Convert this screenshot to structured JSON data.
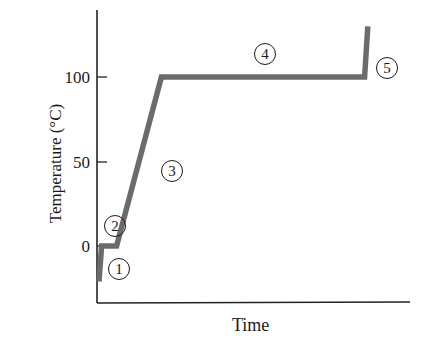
{
  "chart_data": {
    "type": "line",
    "title": "",
    "xlabel": "Time",
    "ylabel": "Temperature (°C)",
    "yticks": [
      0,
      50,
      100
    ],
    "ytick_labels": [
      "0",
      "50",
      "100"
    ],
    "ylim": [
      -33,
      140
    ],
    "xticks": [],
    "grid": false,
    "legend": null,
    "series": [
      {
        "name": "Heating curve",
        "color": "#6b6b6b",
        "x": [
          0.0,
          0.8,
          5.5,
          19.5,
          83.0,
          84.0
        ],
        "y": [
          -21,
          0,
          0,
          100,
          100,
          130
        ]
      }
    ],
    "annotations": [
      {
        "label": "1",
        "text": "①",
        "x": 4.5,
        "y": -14,
        "desc": "heating solid (ice)"
      },
      {
        "label": "2",
        "text": "②",
        "x": 3.5,
        "y": 10,
        "desc": "melting at 0 °C"
      },
      {
        "label": "3",
        "text": "③",
        "x": 17,
        "y": 45,
        "desc": "heating liquid"
      },
      {
        "label": "4",
        "text": "④",
        "x": 41,
        "y": 112,
        "desc": "boiling at 100 °C"
      },
      {
        "label": "5",
        "text": "⑤",
        "x": 88,
        "y": 105,
        "desc": "heating vapor"
      }
    ]
  },
  "axes": {
    "y_tick_labels": [
      "100",
      "50",
      "0"
    ],
    "x_label": "Time",
    "y_label": "Temperature (°C)"
  },
  "phases": [
    "1",
    "2",
    "3",
    "4",
    "5"
  ]
}
